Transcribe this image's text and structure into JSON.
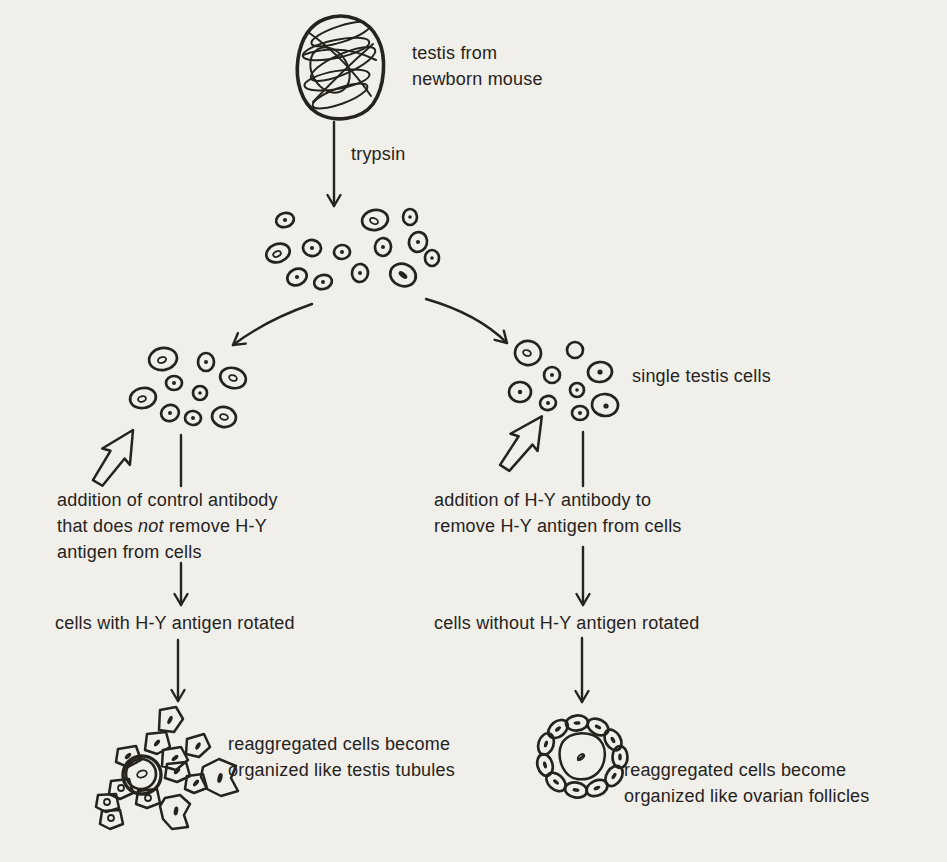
{
  "theme": {
    "background": "#f0efea",
    "ink": "#26231d"
  },
  "figure": {
    "source": {
      "line1": "testis from",
      "line2": "newborn mouse"
    },
    "enzyme": "trypsin",
    "cells_label": "single testis cells",
    "left": {
      "addition_line1": "addition of control antibody",
      "addition_line2_pre": "that does ",
      "addition_line2_em": "not",
      "addition_line2_post": " remove H-Y",
      "addition_line3": "antigen from cells",
      "rotated": "cells with H-Y antigen rotated",
      "result_line1": "reaggregated cells become",
      "result_line2": "organized like testis tubules"
    },
    "right": {
      "addition_line1": "addition of H-Y antibody to",
      "addition_line2": "remove H-Y antigen from cells",
      "rotated": "cells without H-Y antigen rotated",
      "result_line1": "reaggregated cells become",
      "result_line2": "organized like ovarian follicles"
    }
  }
}
